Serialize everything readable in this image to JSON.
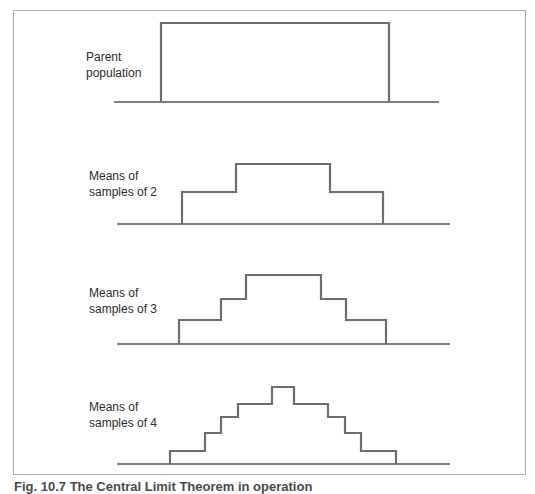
{
  "figure": {
    "caption": "Fig. 10.7 The Central Limit Theorem in operation",
    "line_color": "#6e6e6e",
    "panels": [
      {
        "label_line1": "Parent",
        "label_line2": "population",
        "baseline": {
          "x1": 114,
          "x2": 439,
          "y": 102
        },
        "points": "161,102 161,23 389,23 389,102"
      },
      {
        "label_line1": "Means of",
        "label_line2": "samples of 2",
        "baseline": {
          "x1": 117,
          "x2": 450,
          "y": 224
        },
        "points": "182,224 182,192 236,192 236,164 330,164 330,192 383,192 383,224"
      },
      {
        "label_line1": "Means of",
        "label_line2": "samples of 3",
        "baseline": {
          "x1": 117,
          "x2": 450,
          "y": 344
        },
        "points": "179,344 179,320 221,320 221,299 246,299 246,275 321,275 321,299 346,299 346,320 386,320 386,344"
      },
      {
        "label_line1": "Means of",
        "label_line2": "samples of 4",
        "baseline": {
          "x1": 117,
          "x2": 450,
          "y": 464
        },
        "points": "170,464 170,451 205,451 205,433 221,433 221,417 238,417 238,404 272,404 272,387 294,387 294,404 328,404 328,417 345,417 345,433 361,433 361,451 396,451 396,464"
      }
    ]
  }
}
